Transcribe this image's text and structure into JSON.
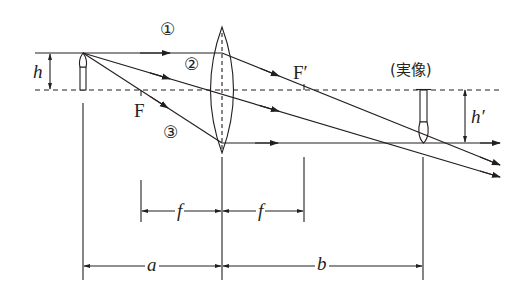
{
  "diagram": {
    "type": "convex-lens-ray-diagram",
    "colors": {
      "line": "#231f20",
      "background": "#ffffff"
    },
    "labels": {
      "ray1": "①",
      "ray2": "②",
      "ray3": "③",
      "focal_front": "F",
      "focal_back": "F′",
      "object_height": "h",
      "image_height": "h′",
      "image_caption": "(実像)",
      "focal_length_left": "f",
      "focal_length_right": "f",
      "object_distance": "a",
      "image_distance": "b"
    }
  }
}
